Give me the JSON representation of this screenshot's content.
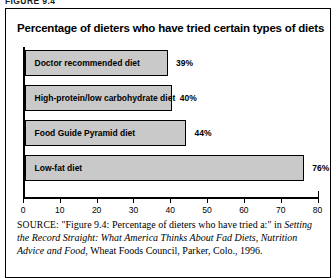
{
  "figure_label": "FIGURE 9.4",
  "chart_data": {
    "type": "bar",
    "orientation": "horizontal",
    "title": "Percentage of dieters who have tried certain types of diets",
    "xlabel": "",
    "ylabel": "",
    "xlim": [
      0,
      80
    ],
    "xticks": [
      0,
      10,
      20,
      30,
      40,
      50,
      60,
      70,
      80
    ],
    "xtick_labels": [
      "0",
      "10",
      "20",
      "30",
      "40",
      "50",
      "60",
      "70",
      "80"
    ],
    "grid": false,
    "legend": null,
    "bar_color": "#c9c9c9",
    "bar_edge_color": "#000000",
    "categories": [
      "Doctor recommended diet",
      "High-protein/low carbohydrate diet",
      "Food Guide Pyramid diet",
      "Low-fat diet"
    ],
    "values": [
      39,
      40,
      44,
      76
    ],
    "value_labels": [
      "39%",
      "40%",
      "44%",
      "76%"
    ]
  },
  "source": {
    "keyword": "SOURCE:",
    "quoted_title": "\"Figure 9.4: Percentage of dieters who have tried a:\"",
    "connector": " in ",
    "book_title": "Setting the Record Straight: What America Thinks About Fad Diets, Nutrition Advice and Food",
    "publisher": ", Wheat Foods Council, Parker, Colo., 1996."
  }
}
